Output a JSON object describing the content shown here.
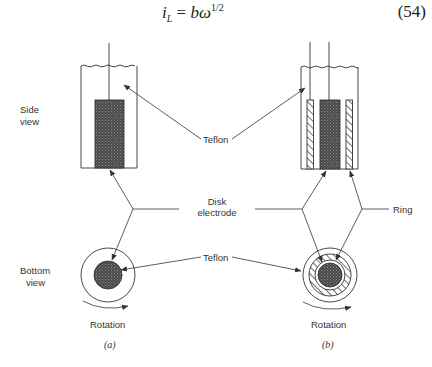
{
  "equation": {
    "lhs_symbol": "i",
    "lhs_subscript": "L",
    "equals": " = ",
    "rhs_base": "bω",
    "rhs_exponent": "1/2",
    "number": "(54)"
  },
  "labels": {
    "side_view": [
      "Side",
      "view"
    ],
    "bottom_view": [
      "Bottom",
      "view"
    ],
    "teflon_top": "Teflon",
    "teflon_bottom": "Teflon",
    "disk_electrode": [
      "Disk",
      "electrode"
    ],
    "ring": "Ring",
    "rotation_a": "Rotation",
    "rotation_b": "Rotation",
    "panel_a": "(a)",
    "panel_b": "(b)"
  },
  "colors": {
    "line": "#333333",
    "electrode_fill": "#555555",
    "background": "#ffffff"
  }
}
